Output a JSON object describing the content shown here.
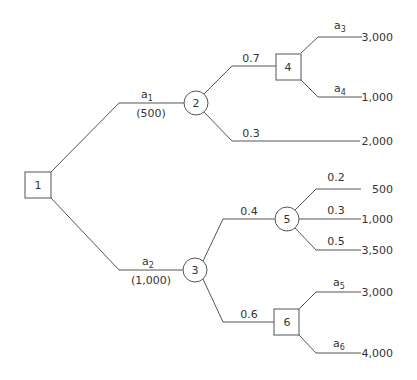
{
  "diagram": {
    "type": "decision-tree",
    "nodes": [
      {
        "id": "1",
        "label": "1",
        "kind": "decision"
      },
      {
        "id": "2",
        "label": "2",
        "kind": "chance"
      },
      {
        "id": "3",
        "label": "3",
        "kind": "chance"
      },
      {
        "id": "4",
        "label": "4",
        "kind": "decision"
      },
      {
        "id": "5",
        "label": "5",
        "kind": "chance"
      },
      {
        "id": "6",
        "label": "6",
        "kind": "decision"
      }
    ],
    "edges": {
      "a1": {
        "base": "a",
        "sub": "1",
        "cost": "(500)"
      },
      "a2": {
        "base": "a",
        "sub": "2",
        "cost": "(1,000)"
      },
      "p2_top": "0.7",
      "p2_bottom": "0.3",
      "a3": {
        "base": "a",
        "sub": "3"
      },
      "a4": {
        "base": "a",
        "sub": "4"
      },
      "p3_top": "0.4",
      "p3_bottom": "0.6",
      "p5_top": "0.2",
      "p5_mid": "0.3",
      "p5_bottom": "0.5",
      "a5": {
        "base": "a",
        "sub": "5"
      },
      "a6": {
        "base": "a",
        "sub": "6"
      }
    },
    "payoffs": {
      "a3": "3,000",
      "a4": "1,000",
      "p2_bottom": "2,000",
      "p5_top": "500",
      "p5_mid": "1,000",
      "p5_bottom": "3,500",
      "a5": "3,000",
      "a6": "4,000"
    }
  }
}
